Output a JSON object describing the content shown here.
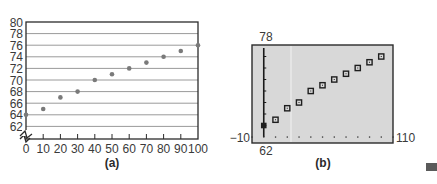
{
  "chart_data": [
    {
      "type": "scatter",
      "caption": "(a)",
      "x": [
        0,
        10,
        20,
        30,
        40,
        50,
        60,
        70,
        80,
        90,
        100
      ],
      "y": [
        64,
        65,
        67,
        68,
        70,
        71,
        72,
        73,
        74,
        75,
        76
      ],
      "xlim": [
        0,
        100
      ],
      "ylim": [
        62,
        80
      ],
      "xticks": [
        "0",
        "10",
        "20",
        "30",
        "40",
        "50",
        "60",
        "70",
        "80",
        "90",
        "100"
      ],
      "yticks": [
        "62",
        "64",
        "66",
        "68",
        "70",
        "72",
        "74",
        "76",
        "78",
        "80"
      ],
      "grid": "horizontal",
      "axis_break": "y-axis break below 62",
      "xlabel": "",
      "ylabel": ""
    },
    {
      "type": "scatter",
      "caption": "(b)",
      "style": "graphing-calculator window",
      "x": [
        0,
        10,
        20,
        30,
        40,
        50,
        60,
        70,
        80,
        90,
        100
      ],
      "y": [
        64,
        65,
        67,
        68,
        70,
        71,
        72,
        73,
        74,
        75,
        76
      ],
      "window": {
        "xmin": -10,
        "xmax": 110,
        "ymin": 62,
        "ymax": 78
      },
      "labels": {
        "ymax": "78",
        "ymin": "62",
        "xmin": "−10",
        "xmax": "110"
      },
      "xscl": 10,
      "yscl": 2
    }
  ],
  "colors": {
    "frame": "#2b2b2b",
    "gridline": "#9a9a9a",
    "point_a": "#7a7a7a",
    "screen_bg": "#d8d8d8",
    "marker_b": "#1e1e1e",
    "corner_square": "#5a5a5a"
  }
}
